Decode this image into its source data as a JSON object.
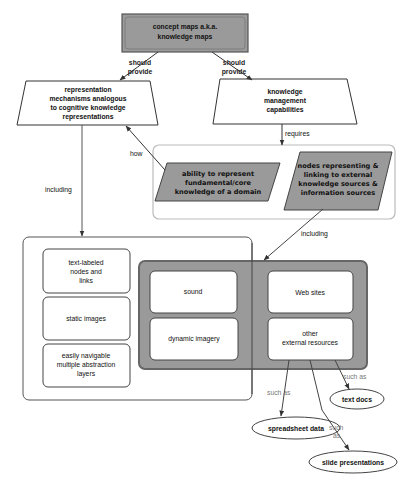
{
  "diagram": {
    "type": "concept map",
    "colors": {
      "root_fill": "#9a9a9a",
      "parallelogram_fill": "#9a9a9a",
      "group_fill": "#9a9a9a",
      "group_border": "#666666",
      "container_border_light": "#bbbbbb",
      "container_border_dark": "#555555",
      "node_fill": "#ffffff",
      "line": "#333333"
    },
    "nodes": {
      "root": {
        "lines": [
          "concept maps a.k.a.",
          "knowledge maps"
        ]
      },
      "representation": {
        "lines": [
          "representation",
          "mechanisms analogous",
          "to cognitive knowledge",
          "representations"
        ]
      },
      "km": {
        "lines": [
          "knowledge",
          "management",
          "capabilities"
        ]
      },
      "ability": {
        "lines": [
          "ability to represent",
          "fundamental/core",
          "knowledge of a domain"
        ]
      },
      "nodes_linking": {
        "lines": [
          "nodes representing &",
          "linking to external",
          "knowledge sources &",
          "information sources"
        ]
      },
      "text_labeled": {
        "lines": [
          "text-labeled",
          "nodes and",
          "links"
        ]
      },
      "static_images": {
        "lines": [
          "static images"
        ]
      },
      "navigable": {
        "lines": [
          "easily navigable",
          "multiple abstraction",
          "layers"
        ]
      },
      "sound": {
        "lines": [
          "sound"
        ]
      },
      "dynamic_imagery": {
        "lines": [
          "dynamic imagery"
        ]
      },
      "web_sites": {
        "lines": [
          "Web sites"
        ]
      },
      "other_external": {
        "lines": [
          "other",
          "external resources"
        ]
      },
      "text_docs": {
        "lines": [
          "text docs"
        ]
      },
      "spreadsheet": {
        "lines": [
          "spreadsheet data"
        ]
      },
      "slides": {
        "lines": [
          "slide presentations"
        ]
      }
    },
    "links": {
      "should_provide_left": [
        "should",
        "provide"
      ],
      "should_provide_right": [
        "should",
        "provide"
      ],
      "requires": "requires",
      "how": "how",
      "including_left": "including",
      "including_right": "including",
      "such_as_text_docs": "such as",
      "such_as_spreadsheet": "such as",
      "such_as_slides": [
        "such",
        "as"
      ]
    }
  }
}
